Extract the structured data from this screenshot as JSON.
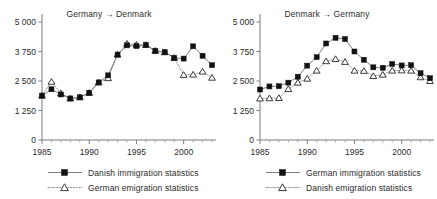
{
  "figure": {
    "width": 437,
    "height": 199,
    "background": "#ffffff",
    "arrow_glyph": "→",
    "marker_colors": {
      "square_fill": "#111111",
      "triangle_fill": "#ffffff",
      "triangle_stroke": "#1a1a1a",
      "line": "#6f6f6f"
    }
  },
  "chart_data": [
    {
      "type": "line",
      "title": "Germany → Denmark",
      "xlabel": "",
      "ylabel": "",
      "xlim": [
        1985,
        2003
      ],
      "ylim": [
        0,
        5000
      ],
      "grid": false,
      "legend_position": "bottom",
      "ytick_labels": [
        "0",
        "1 250",
        "2 500",
        "3 750",
        "5 000"
      ],
      "ytick_values": [
        0,
        1250,
        2500,
        3750,
        5000
      ],
      "xtick_labels": [
        "1985",
        "1990",
        "1995",
        "2000"
      ],
      "xtick_values": [
        1985,
        1990,
        1995,
        2000
      ],
      "x": [
        1985,
        1986,
        1987,
        1988,
        1989,
        1990,
        1991,
        1992,
        1993,
        1994,
        1995,
        1996,
        1997,
        1998,
        1999,
        2000,
        2001,
        2002,
        2003
      ],
      "series": [
        {
          "name": "Danish immigration statistics",
          "marker": "filled-square",
          "linestyle": "solid",
          "values": [
            1880,
            2150,
            1930,
            1760,
            1810,
            2000,
            2440,
            2740,
            3620,
            4010,
            3980,
            4030,
            3780,
            3720,
            3480,
            3450,
            3970,
            3570,
            3170
          ]
        },
        {
          "name": "German emigration statistics",
          "marker": "open-triangle",
          "linestyle": "dotted",
          "values": [
            1880,
            2470,
            1980,
            1760,
            1810,
            2000,
            2440,
            2620,
            3620,
            4080,
            4040,
            4030,
            3780,
            3720,
            3480,
            2760,
            2770,
            2900,
            2640
          ]
        }
      ]
    },
    {
      "type": "line",
      "title": "Denmark → Germany",
      "xlabel": "",
      "ylabel": "",
      "xlim": [
        1985,
        2003
      ],
      "ylim": [
        0,
        5000
      ],
      "grid": false,
      "legend_position": "bottom",
      "ytick_labels": [
        "0",
        "1 250",
        "2 500",
        "3 750",
        "5 000"
      ],
      "ytick_values": [
        0,
        1250,
        2500,
        3750,
        5000
      ],
      "xtick_labels": [
        "1985",
        "1990",
        "1995",
        "2000"
      ],
      "xtick_values": [
        1985,
        1990,
        1995,
        2000
      ],
      "x": [
        1985,
        1986,
        1987,
        1988,
        1989,
        1990,
        1991,
        1992,
        1993,
        1994,
        1995,
        1996,
        1997,
        1998,
        1999,
        2000,
        2001,
        2002,
        2003
      ],
      "series": [
        {
          "name": "German immigration statistics",
          "marker": "filled-square",
          "linestyle": "solid",
          "values": [
            2140,
            2270,
            2280,
            2430,
            2680,
            3150,
            3510,
            4090,
            4330,
            4280,
            3750,
            3400,
            3080,
            3060,
            3220,
            3160,
            3170,
            2830,
            2620
          ]
        },
        {
          "name": "Danish emigration statistics",
          "marker": "open-triangle",
          "linestyle": "dotted",
          "values": [
            1760,
            1770,
            1780,
            2160,
            2430,
            2600,
            2940,
            3340,
            3430,
            3310,
            2940,
            2930,
            2710,
            2770,
            2940,
            2950,
            2940,
            2660,
            2500
          ]
        }
      ]
    }
  ]
}
